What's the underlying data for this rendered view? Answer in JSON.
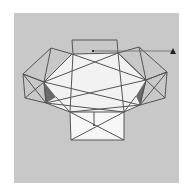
{
  "diagram": {
    "background_color": "#c8c8c8",
    "face_color": "#f0f0f0",
    "edge_color": "#555555",
    "shadow_color": "#6a6a6a",
    "marker": "triangle-marker",
    "reference_line": "horizontal guide from top face center to marker"
  }
}
